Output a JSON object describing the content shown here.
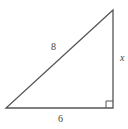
{
  "diagram": {
    "type": "right-triangle",
    "stroke_color": "#555555",
    "background": "#ffffff",
    "vertices": {
      "bottom_left": [
        6,
        108
      ],
      "bottom_right": [
        113,
        108
      ],
      "top_right": [
        113,
        10
      ]
    },
    "right_angle_at": "bottom_right",
    "labels": {
      "hypotenuse": "8",
      "vertical_leg": "x",
      "base": "6"
    }
  }
}
